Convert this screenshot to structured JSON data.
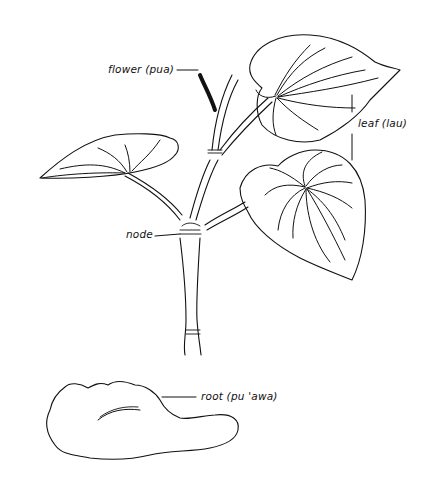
{
  "figure": {
    "labels": {
      "flower": "flower (pua)",
      "leaf": "leaf (lau)",
      "node": "node",
      "root": "root (pu 'awa)"
    },
    "colors": {
      "ink": "#111111",
      "background": "#ffffff"
    }
  }
}
